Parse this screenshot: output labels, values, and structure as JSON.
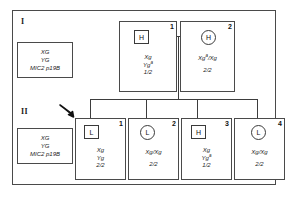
{
  "figure": {
    "line_color": "#3d3d3d",
    "frame_color": "#4a4a4a",
    "background": "#ffffff"
  },
  "generations": [
    {
      "label": "I",
      "name": "generation-one"
    },
    {
      "label": "II",
      "name": "generation-two"
    }
  ],
  "legends": [
    {
      "name": "legend-generation-one",
      "lines": [
        "XG",
        "YG",
        "MIC2 p19B"
      ]
    },
    {
      "name": "legend-generation-two",
      "lines": [
        "XG",
        "YG",
        "MIC2 p19B"
      ]
    }
  ],
  "individuals": [
    {
      "id": "I-1",
      "generation": "I",
      "number": "1",
      "sex": "male",
      "symbol": "square",
      "symbol_letter": "H",
      "genotype": [
        {
          "text": "Xg",
          "sup": ""
        },
        {
          "text": "Yg",
          "sup": "a"
        }
      ],
      "dosage": "1/2"
    },
    {
      "id": "I-2",
      "generation": "I",
      "number": "2",
      "sex": "female",
      "symbol": "circle",
      "symbol_letter": "H",
      "genotype": [
        {
          "text": "Xg",
          "sup": "a",
          "suffix": "/Xg"
        }
      ],
      "dosage": "2/2"
    },
    {
      "id": "II-1",
      "generation": "II",
      "number": "1",
      "sex": "male",
      "symbol": "square",
      "symbol_letter": "L",
      "proband": true,
      "genotype": [
        {
          "text": "Xg",
          "sup": ""
        },
        {
          "text": "Yg",
          "sup": ""
        }
      ],
      "dosage": "2/2"
    },
    {
      "id": "II-2",
      "generation": "II",
      "number": "2",
      "sex": "female",
      "symbol": "circle",
      "symbol_letter": "L",
      "genotype": [
        {
          "text": "Xg/Xg",
          "sup": ""
        }
      ],
      "dosage": "2/2"
    },
    {
      "id": "II-3",
      "generation": "II",
      "number": "3",
      "sex": "male",
      "symbol": "square",
      "symbol_letter": "H",
      "genotype": [
        {
          "text": "Xg",
          "sup": ""
        },
        {
          "text": "Yg",
          "sup": "a"
        }
      ],
      "dosage": "1/2"
    },
    {
      "id": "II-4",
      "generation": "II",
      "number": "4",
      "sex": "female",
      "symbol": "circle",
      "symbol_letter": "L",
      "genotype": [
        {
          "text": "Xg/Xg",
          "sup": ""
        }
      ],
      "dosage": "2/2"
    }
  ],
  "annotations": {
    "proband_arrow": "proband-arrow"
  }
}
